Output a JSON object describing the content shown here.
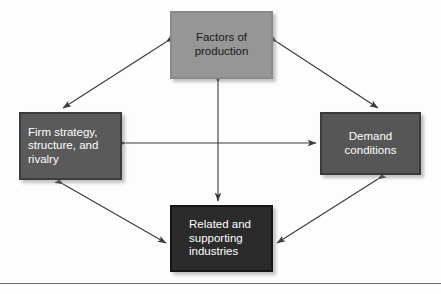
{
  "diagram": {
    "background_color": "#fdfdfd",
    "nodes": [
      {
        "id": "factors",
        "label": "Factors of production",
        "lines": [
          "Factors of",
          "production"
        ],
        "fill_color": "#969696",
        "text_color": "#1a1a1a",
        "position": "top"
      },
      {
        "id": "firm",
        "label": "Firm strategy, structure, and rivalry",
        "lines": [
          "Firm strategy,",
          "structure, and",
          "rivalry"
        ],
        "fill_color": "#5a5a5a",
        "text_color": "#ffffff",
        "position": "left"
      },
      {
        "id": "demand",
        "label": "Demand conditions",
        "lines": [
          "Demand",
          "conditions"
        ],
        "fill_color": "#565656",
        "text_color": "#ffffff",
        "position": "right"
      },
      {
        "id": "related",
        "label": "Related and supporting industries",
        "lines": [
          "Related and",
          "supporting",
          "industries"
        ],
        "fill_color": "#2b2b2b",
        "text_color": "#ffffff",
        "position": "bottom"
      }
    ],
    "connectors": [
      {
        "id": "factors-firm",
        "from": "factors",
        "to": "firm",
        "style": "double-headed"
      },
      {
        "id": "factors-demand",
        "from": "factors",
        "to": "demand",
        "style": "double-headed"
      },
      {
        "id": "firm-related",
        "from": "firm",
        "to": "related",
        "style": "double-headed"
      },
      {
        "id": "demand-related",
        "from": "demand",
        "to": "related",
        "style": "double-headed"
      },
      {
        "id": "firm-demand",
        "from": "firm",
        "to": "demand",
        "style": "double-headed"
      },
      {
        "id": "factors-related",
        "from": "factors",
        "to": "related",
        "style": "double-headed"
      }
    ],
    "connector_color": "#3a3a3a",
    "rule_color": "#6e6e6e"
  }
}
